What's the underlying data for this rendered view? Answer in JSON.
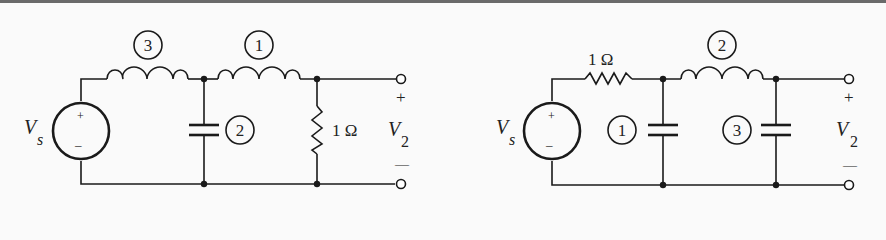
{
  "circuits": [
    {
      "id": "left",
      "source_label": "V",
      "source_subscript": "s",
      "source_plus": "+",
      "source_minus": "–",
      "output_label": "V",
      "output_subscript": "2",
      "output_plus": "+",
      "output_minus": "—",
      "components": [
        {
          "type": "inductor",
          "tag": "3",
          "position": "series-first"
        },
        {
          "type": "capacitor",
          "tag": "2",
          "position": "shunt"
        },
        {
          "type": "inductor",
          "tag": "1",
          "position": "series-second"
        },
        {
          "type": "resistor",
          "value": "1 Ω",
          "position": "load-shunt"
        }
      ]
    },
    {
      "id": "right",
      "source_label": "V",
      "source_subscript": "s",
      "source_plus": "+",
      "source_minus": "–",
      "output_label": "V",
      "output_subscript": "2",
      "output_plus": "+",
      "output_minus": "—",
      "components": [
        {
          "type": "resistor",
          "value": "1 Ω",
          "position": "series-source"
        },
        {
          "type": "capacitor",
          "tag": "1",
          "position": "shunt-first"
        },
        {
          "type": "inductor",
          "tag": "2",
          "position": "series"
        },
        {
          "type": "capacitor",
          "tag": "3",
          "position": "shunt-second"
        }
      ]
    }
  ]
}
